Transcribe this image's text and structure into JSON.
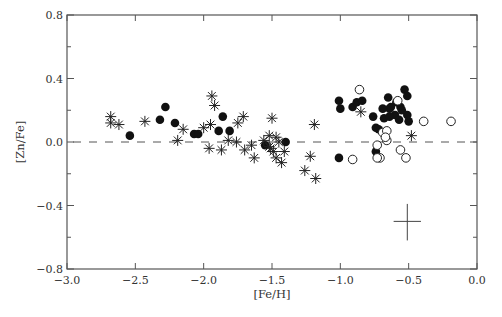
{
  "chart_data": {
    "type": "scatter",
    "title": "",
    "xlabel": "[Fe/H]",
    "ylabel": "[Zn/Fe]",
    "xlim": [
      -3.0,
      0.0
    ],
    "ylim": [
      -0.8,
      0.8
    ],
    "x_ticks": [
      "-3.0",
      "-2.5",
      "-2.0",
      "-1.5",
      "-1.0",
      "-0.5",
      "0.0"
    ],
    "x_tick_values": [
      -3.0,
      -2.5,
      -2.0,
      -1.5,
      -1.0,
      -0.5,
      0.0
    ],
    "x_minor_ticks": [],
    "y_ticks": [
      "-0.8",
      "-0.4",
      "0.0",
      "0.4",
      "0.8"
    ],
    "y_tick_values": [
      -0.8,
      -0.4,
      0.0,
      0.4,
      0.8
    ],
    "y_minor_ticks": [
      -0.6,
      -0.2,
      0.2,
      0.6
    ],
    "grid": false,
    "legend": null,
    "reference_line": {
      "y": 0.0,
      "style": "dashed"
    },
    "error_bar": {
      "x": -0.51,
      "y": -0.5,
      "xerr": 0.1,
      "yerr_up": 0.11,
      "yerr_down": 0.12
    },
    "series": [
      {
        "name": "filled-circles",
        "marker": "filled-circle",
        "points": [
          [
            -2.54,
            0.04
          ],
          [
            -2.32,
            0.14
          ],
          [
            -2.28,
            0.22
          ],
          [
            -2.21,
            0.12
          ],
          [
            -2.07,
            0.05
          ],
          [
            -2.04,
            0.05
          ],
          [
            -1.86,
            0.16
          ],
          [
            -1.89,
            0.07
          ],
          [
            -1.81,
            0.07
          ],
          [
            -1.55,
            -0.02
          ],
          [
            -1.4,
            0.0
          ],
          [
            -1.01,
            0.26
          ],
          [
            -1.0,
            0.21
          ],
          [
            -1.01,
            -0.1
          ],
          [
            -0.91,
            0.22
          ],
          [
            -0.88,
            0.25
          ],
          [
            -0.84,
            0.26
          ],
          [
            -0.76,
            0.16
          ],
          [
            -0.74,
            0.09
          ],
          [
            -0.74,
            -0.06
          ],
          [
            -0.64,
            0.21
          ],
          [
            -0.68,
            0.15
          ],
          [
            -0.6,
            0.17
          ],
          [
            -0.53,
            0.33
          ],
          [
            -0.51,
            0.29
          ],
          [
            -0.69,
            0.21
          ],
          [
            -0.64,
            0.16
          ],
          [
            -0.56,
            0.22
          ],
          [
            -0.57,
            0.14
          ],
          [
            -0.51,
            0.17
          ],
          [
            -0.5,
            0.13
          ],
          [
            -0.72,
            0.08
          ],
          [
            -0.63,
            0.22
          ],
          [
            -0.65,
            0.28
          ],
          [
            -0.59,
            0.25
          ],
          [
            -0.55,
            0.2
          ]
        ]
      },
      {
        "name": "open-circles",
        "marker": "open-circle",
        "points": [
          [
            -0.86,
            0.33
          ],
          [
            -0.91,
            -0.11
          ],
          [
            -0.69,
            0.06
          ],
          [
            -0.66,
            0.07
          ],
          [
            -0.66,
            0.01
          ],
          [
            -0.73,
            -0.02
          ],
          [
            -0.71,
            -0.1
          ],
          [
            -0.56,
            -0.05
          ],
          [
            -0.52,
            -0.1
          ],
          [
            -0.58,
            0.26
          ],
          [
            -0.39,
            0.13
          ],
          [
            -0.19,
            0.13
          ],
          [
            -0.73,
            -0.1
          ],
          [
            -0.67,
            0.03
          ]
        ]
      },
      {
        "name": "asterisks",
        "marker": "asterisk",
        "points": [
          [
            -2.68,
            0.16
          ],
          [
            -2.68,
            0.12
          ],
          [
            -2.62,
            0.11
          ],
          [
            -2.43,
            0.13
          ],
          [
            -2.19,
            0.01
          ],
          [
            -2.15,
            0.08
          ],
          [
            -2.0,
            0.09
          ],
          [
            -1.95,
            0.11
          ],
          [
            -1.94,
            0.29
          ],
          [
            -1.92,
            0.23
          ],
          [
            -1.96,
            -0.04
          ],
          [
            -1.87,
            -0.05
          ],
          [
            -1.82,
            0.01
          ],
          [
            -1.71,
            0.16
          ],
          [
            -1.75,
            0.12
          ],
          [
            -1.76,
            0.0
          ],
          [
            -1.7,
            -0.05
          ],
          [
            -1.63,
            -0.1
          ],
          [
            -1.65,
            -0.02
          ],
          [
            -1.56,
            0.01
          ],
          [
            -1.52,
            -0.03
          ],
          [
            -1.47,
            0.03
          ],
          [
            -1.49,
            -0.06
          ],
          [
            -1.45,
            0.0
          ],
          [
            -1.51,
            -0.04
          ],
          [
            -1.41,
            -0.06
          ],
          [
            -1.43,
            -0.13
          ],
          [
            -1.47,
            -0.1
          ],
          [
            -1.5,
            0.15
          ],
          [
            -1.26,
            -0.18
          ],
          [
            -1.22,
            -0.09
          ],
          [
            -1.18,
            -0.23
          ],
          [
            -1.19,
            0.11
          ],
          [
            -0.85,
            0.19
          ],
          [
            -0.48,
            0.04
          ],
          [
            -1.52,
            0.04
          ]
        ]
      }
    ]
  }
}
